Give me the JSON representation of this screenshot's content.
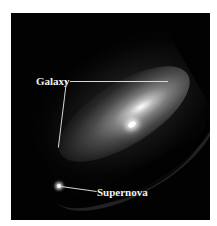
{
  "image": {
    "description": "Astronomical photograph of an edge-on spiral galaxy with a bright supernova below it",
    "background_color": "#020202",
    "annotation_color": "#f2f2f2"
  },
  "annotations": [
    {
      "id": "galaxy",
      "label": "Galaxy"
    },
    {
      "id": "supernova",
      "label": "Supernova"
    }
  ]
}
